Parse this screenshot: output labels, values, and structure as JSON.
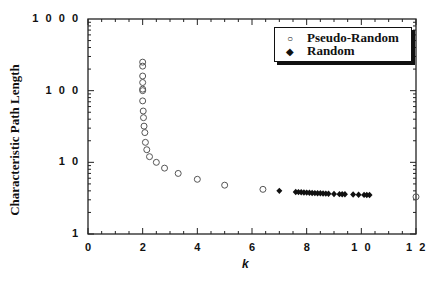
{
  "chart_data": {
    "type": "scatter",
    "title": "",
    "xlabel": "k",
    "ylabel": "Characteristic Path Length",
    "xlim": [
      0,
      12
    ],
    "ylim": [
      1,
      1000
    ],
    "yscale": "log",
    "x_ticks": [
      "0",
      "2",
      "4",
      "6",
      "8",
      "1 0",
      "1 2"
    ],
    "y_ticks": [
      "1",
      "1 0",
      "1 0 0",
      "1 0 0 0"
    ],
    "grid": false,
    "legend_position": "upper right",
    "series": [
      {
        "name": "Pseudo-Random",
        "marker": "open-circle",
        "points": [
          [
            2.0,
            250
          ],
          [
            2.0,
            220
          ],
          [
            2.0,
            160
          ],
          [
            2.0,
            130
          ],
          [
            2.0,
            105
          ],
          [
            2.0,
            100
          ],
          [
            2.0,
            72
          ],
          [
            2.02,
            52
          ],
          [
            2.03,
            42
          ],
          [
            2.05,
            32
          ],
          [
            2.08,
            26
          ],
          [
            2.1,
            19
          ],
          [
            2.15,
            15
          ],
          [
            2.25,
            12
          ],
          [
            2.5,
            10
          ],
          [
            2.8,
            8.3
          ],
          [
            3.3,
            7.0
          ],
          [
            4.0,
            5.8
          ],
          [
            5.0,
            4.8
          ],
          [
            6.4,
            4.2
          ],
          [
            12.0,
            3.3
          ]
        ]
      },
      {
        "name": "Random",
        "marker": "filled-diamond",
        "points": [
          [
            7.0,
            4.0
          ],
          [
            7.6,
            3.85
          ],
          [
            7.7,
            3.84
          ],
          [
            7.8,
            3.82
          ],
          [
            7.9,
            3.8
          ],
          [
            8.0,
            3.78
          ],
          [
            8.1,
            3.76
          ],
          [
            8.2,
            3.74
          ],
          [
            8.3,
            3.72
          ],
          [
            8.4,
            3.71
          ],
          [
            8.5,
            3.7
          ],
          [
            8.6,
            3.68
          ],
          [
            8.7,
            3.66
          ],
          [
            8.8,
            3.65
          ],
          [
            9.0,
            3.62
          ],
          [
            9.2,
            3.6
          ],
          [
            9.3,
            3.59
          ],
          [
            9.4,
            3.58
          ],
          [
            9.7,
            3.55
          ],
          [
            9.9,
            3.53
          ],
          [
            10.1,
            3.51
          ],
          [
            10.2,
            3.5
          ],
          [
            10.3,
            3.5
          ]
        ]
      }
    ]
  },
  "axes": {
    "xlabel": "k",
    "ylabel": "Characteristic Path Length"
  },
  "legend": {
    "items": [
      {
        "label": "Pseudo-Random",
        "symbol": "○"
      },
      {
        "label": "Random",
        "symbol": "◆"
      }
    ]
  }
}
